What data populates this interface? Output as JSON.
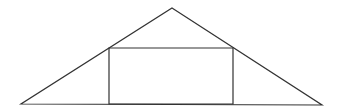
{
  "diagram": {
    "width": 340,
    "height": 111,
    "background": "#ffffff",
    "stroke_color": "#333333",
    "stroke_width": 1.2,
    "triangle": {
      "apex": [
        172,
        8
      ],
      "left_base": [
        21,
        104
      ],
      "right_base": [
        322,
        105
      ]
    },
    "rectangle": {
      "top_left": [
        109,
        48
      ],
      "top_right": [
        233,
        48
      ],
      "bottom_right": [
        233,
        104
      ],
      "bottom_left": [
        109,
        104
      ]
    }
  }
}
